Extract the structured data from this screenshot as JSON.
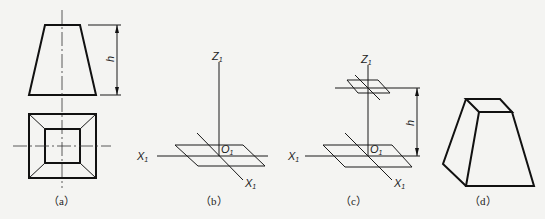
{
  "figure": {
    "panels": [
      {
        "id": "a",
        "caption": "（a）",
        "dimension_label": "h",
        "description": "Orthographic views of a truncated square pyramid: front view (trapezoid) and top view (square with inner square)"
      },
      {
        "id": "b",
        "caption": "（b）",
        "axis_z": "Z",
        "axis_z_sub": "1",
        "origin": "O",
        "origin_sub": "1",
        "axis_x_left": "X",
        "axis_x_left_sub": "1",
        "axis_x_right": "X",
        "axis_x_right_sub": "1",
        "description": "Oblique axes with base square parallelogram"
      },
      {
        "id": "c",
        "caption": "（c）",
        "axis_z": "Z",
        "axis_z_sub": "1",
        "origin": "O",
        "origin_sub": "1",
        "axis_x_left": "X",
        "axis_x_left_sub": "1",
        "axis_x_right": "X",
        "axis_x_right_sub": "1",
        "dimension_label": "h",
        "description": "Top face parallelogram placed at height h above base"
      },
      {
        "id": "d",
        "caption": "（d）",
        "description": "Finished oblique drawing of truncated pyramid"
      }
    ]
  }
}
